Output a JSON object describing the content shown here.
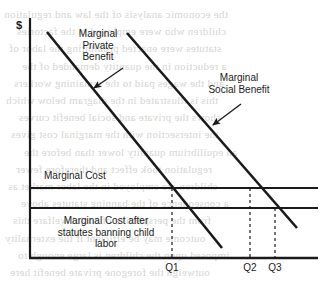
{
  "figure": {
    "axis_unit_label": "$",
    "labels": {
      "marginal_private_benefit": "Marginal\nPrivate\nBenefit",
      "marginal_social_benefit": "Marginal\nSocial Benefit",
      "marginal_cost": "Marginal Cost",
      "marginal_cost_after_statutes": "Marginal Cost after\nstatutes banning child\nlabor"
    },
    "quantity_ticks": [
      {
        "name": "q1-label",
        "text": "Q1"
      },
      {
        "name": "q2-label",
        "text": "Q2"
      },
      {
        "name": "q3-label",
        "text": "Q3"
      }
    ],
    "colors": {
      "ink": "#1a1a1a",
      "paper": "#ffffff",
      "bleed_text": "#c8c5c2"
    }
  },
  "bleed_through": {
    "note": "faint mirrored text showing through from the reverse side of the scanned page",
    "rows": [
      "the economic analysis of the law and regulation",
      "children who were employed in the factories",
      "statutes were enacted prohibiting the labor of",
      "a reduction in the quantity demanded of the",
      "and the wages paid to the remaining workers",
      "this is illustrated in the diagram below which",
      "shows the private and social benefit curves",
      "the intersection with the marginal cost gives",
      "an equilibrium quantity lower than before the",
      "regulation took effect and therefore fewer",
      "children are employed in the labor market as",
      "a consequence of the banning statutes above",
      "from the perspective of social welfare this",
      "outcome may be efficient if the externality",
      "imposed upon the children is large enough to",
      "outweigh the foregone private benefit here"
    ]
  },
  "chart_data": {
    "type": "line",
    "xlabel": "",
    "ylabel": "$",
    "xlim": [
      0,
      100
    ],
    "ylim": [
      0,
      100
    ],
    "grid": false,
    "legend": "none",
    "annotations": [
      {
        "name": "mpb-annotation",
        "text": "Marginal\nPrivate\nBenefit",
        "points_to": "marginal-private-benefit-curve"
      },
      {
        "name": "msb-annotation",
        "text": "Marginal\nSocial Benefit",
        "points_to": "marginal-social-benefit-curve"
      },
      {
        "name": "mc-annotation",
        "text": "Marginal Cost",
        "points_to": "marginal-cost-line"
      },
      {
        "name": "mc-after-annotation",
        "text": "Marginal Cost after\nstatutes banning child\nlabor",
        "points_to": "marginal-cost-after-statutes-line"
      }
    ],
    "series": [
      {
        "name": "Marginal Private Benefit",
        "type": "line",
        "style": "solid",
        "x": [
          5.9,
          80.0
        ],
        "y": [
          94.2,
          4.2
        ]
      },
      {
        "name": "Marginal Social Benefit",
        "type": "line",
        "style": "solid",
        "x": [
          33.7,
          92.7
        ],
        "y": [
          93.8,
          12.5
        ]
      },
      {
        "name": "Marginal Cost",
        "type": "hline",
        "style": "solid",
        "x": [
          0,
          100
        ],
        "y": [
          29.2,
          29.2
        ]
      },
      {
        "name": "Marginal Cost after statutes banning child labor",
        "type": "hline",
        "style": "solid",
        "x": [
          0,
          100
        ],
        "y": [
          20.8,
          20.8
        ]
      }
    ],
    "dropline_markers": [
      {
        "label": "Q1",
        "x": 49.3,
        "y_top": 29.2,
        "intersection": "Marginal Private Benefit x Marginal Cost"
      },
      {
        "label": "Q2",
        "x": 76.4,
        "y_top": 29.2,
        "intersection": "Marginal Social Benefit x Marginal Cost"
      },
      {
        "label": "Q3",
        "x": 85.1,
        "y_top": 20.8,
        "intersection": "Marginal Social Benefit x Marginal Cost after statutes"
      }
    ]
  }
}
